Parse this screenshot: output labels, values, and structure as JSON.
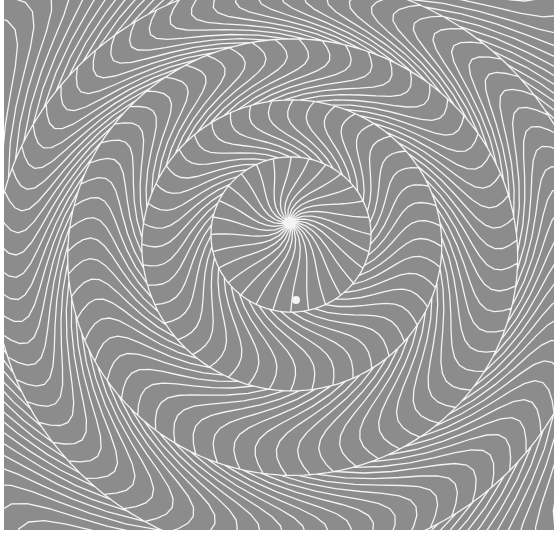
{
  "artwork": {
    "type": "op-art spiral pattern",
    "background_color": "#8c8c8c",
    "line_color": "#f4f4f4",
    "centers": [
      {
        "x": 290,
        "y": 222
      },
      {
        "x": 296,
        "y": 300
      }
    ],
    "rings": [
      {
        "r_in": 0,
        "r_out": 80,
        "count": 28,
        "twist": 0.9
      },
      {
        "r_in": 80,
        "r_out": 150,
        "count": 44,
        "twist": -0.55
      },
      {
        "r_in": 150,
        "r_out": 225,
        "count": 60,
        "twist": 0.5
      },
      {
        "r_in": 225,
        "r_out": 300,
        "count": 76,
        "twist": -0.45
      },
      {
        "r_in": 300,
        "r_out": 420,
        "count": 92,
        "twist": 0.4
      }
    ]
  }
}
